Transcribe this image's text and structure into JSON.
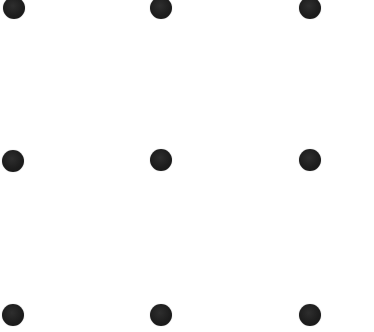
{
  "grid": {
    "rows": 3,
    "cols": 3,
    "dot_diameter": 22,
    "dot_color": "#1c1c1c",
    "background_color": "#ffffff",
    "dots": [
      {
        "row": 0,
        "col": 0,
        "cx": 14,
        "cy": 8
      },
      {
        "row": 0,
        "col": 1,
        "cx": 161,
        "cy": 8
      },
      {
        "row": 0,
        "col": 2,
        "cx": 310,
        "cy": 8
      },
      {
        "row": 1,
        "col": 0,
        "cx": 13,
        "cy": 161
      },
      {
        "row": 1,
        "col": 1,
        "cx": 161,
        "cy": 160
      },
      {
        "row": 1,
        "col": 2,
        "cx": 310,
        "cy": 160
      },
      {
        "row": 2,
        "col": 0,
        "cx": 13,
        "cy": 315
      },
      {
        "row": 2,
        "col": 1,
        "cx": 161,
        "cy": 315
      },
      {
        "row": 2,
        "col": 2,
        "cx": 310,
        "cy": 315
      }
    ]
  }
}
